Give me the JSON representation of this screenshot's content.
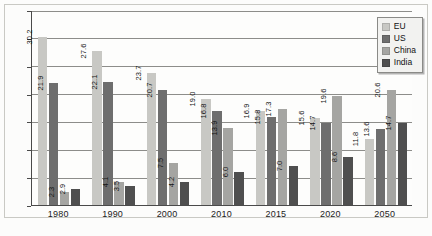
{
  "chart_data": {
    "type": "bar",
    "title": "",
    "subtitle": "",
    "xlabel": "",
    "ylabel": "",
    "categories": [
      "1980",
      "1990",
      "2000",
      "2010",
      "2015",
      "2020",
      "2050"
    ],
    "series": [
      {
        "name": "EU",
        "color": "#c8c8c4",
        "values": [
          30.2,
          27.6,
          23.7,
          19.0,
          16.9,
          15.6,
          11.8
        ]
      },
      {
        "name": "US",
        "color": "#6e6e6e",
        "values": [
          21.9,
          22.1,
          20.7,
          16.8,
          15.8,
          14.7,
          13.6
        ]
      },
      {
        "name": "China",
        "color": "#a5a5a2",
        "values": [
          2.3,
          4.1,
          7.5,
          13.9,
          17.3,
          19.6,
          20.6
        ]
      },
      {
        "name": "India",
        "color": "#4f4f4f",
        "values": [
          2.9,
          3.5,
          4.2,
          6.0,
          7.0,
          8.6,
          14.7
        ]
      }
    ],
    "value_labels": [
      [
        "30.2",
        "21.9",
        "2.3",
        "2.9"
      ],
      [
        "27.6",
        "22.1",
        "4.1",
        "3.5"
      ],
      [
        "23.7",
        "20.7",
        "7.5",
        "4.2"
      ],
      [
        "19.0",
        "16.8",
        "13.9",
        "6.0"
      ],
      [
        "16.9",
        "15.8",
        "17.3",
        "7.0"
      ],
      [
        "15.6",
        "14.7",
        "19.6",
        "8.6"
      ],
      [
        "11.8",
        "13.6",
        "20.6",
        "14.7"
      ]
    ],
    "ylim": [
      0.0,
      35.0
    ],
    "ytick_step": 5.0,
    "ytick_labels": [
      "0.0",
      "5.0",
      "10.0",
      "15.0",
      "20.0",
      "25.0",
      "30.0",
      "35.0"
    ],
    "grid": true,
    "grid_axis": "y",
    "legend_position": "top-right",
    "legend_entries": [
      "EU",
      "US",
      "China",
      "India"
    ],
    "background_color": "#fcfcfb",
    "axis_color": "#4a4a4a",
    "grid_color": "#8d8d8a"
  }
}
